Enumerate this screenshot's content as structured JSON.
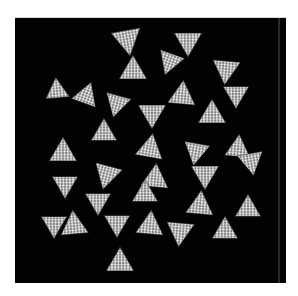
{
  "caption": {
    "text": ""
  },
  "figure": {
    "background_color": "#020202",
    "particle_color": "#e8e8e8",
    "panel": {
      "x": 15,
      "y": 17,
      "width": 271,
      "height": 265
    },
    "particles": [
      {
        "cx": 127,
        "cy": 38,
        "size": 28,
        "rot": 170
      },
      {
        "cx": 188,
        "cy": 40,
        "size": 26,
        "rot": 180
      },
      {
        "cx": 133,
        "cy": 70,
        "size": 26,
        "rot": 0
      },
      {
        "cx": 170,
        "cy": 60,
        "size": 24,
        "rot": 200
      },
      {
        "cx": 226,
        "cy": 68,
        "size": 26,
        "rot": 185
      },
      {
        "cx": 57,
        "cy": 90,
        "size": 22,
        "rot": 355
      },
      {
        "cx": 86,
        "cy": 95,
        "size": 24,
        "rot": 20
      },
      {
        "cx": 117,
        "cy": 102,
        "size": 24,
        "rot": 195
      },
      {
        "cx": 182,
        "cy": 95,
        "size": 26,
        "rot": 5
      },
      {
        "cx": 236,
        "cy": 93,
        "size": 24,
        "rot": 180
      },
      {
        "cx": 212,
        "cy": 114,
        "size": 26,
        "rot": 0
      },
      {
        "cx": 152,
        "cy": 112,
        "size": 26,
        "rot": 180
      },
      {
        "cx": 104,
        "cy": 132,
        "size": 24,
        "rot": 0
      },
      {
        "cx": 63,
        "cy": 152,
        "size": 26,
        "rot": 0
      },
      {
        "cx": 150,
        "cy": 148,
        "size": 26,
        "rot": 10
      },
      {
        "cx": 196,
        "cy": 150,
        "size": 24,
        "rot": 190
      },
      {
        "cx": 238,
        "cy": 148,
        "size": 24,
        "rot": 5
      },
      {
        "cx": 205,
        "cy": 173,
        "size": 26,
        "rot": 180
      },
      {
        "cx": 107,
        "cy": 173,
        "size": 26,
        "rot": 195
      },
      {
        "cx": 65,
        "cy": 183,
        "size": 24,
        "rot": 180
      },
      {
        "cx": 155,
        "cy": 178,
        "size": 26,
        "rot": 5
      },
      {
        "cx": 251,
        "cy": 160,
        "size": 24,
        "rot": 170
      },
      {
        "cx": 98,
        "cy": 200,
        "size": 24,
        "rot": 180
      },
      {
        "cx": 145,
        "cy": 193,
        "size": 24,
        "rot": 0
      },
      {
        "cx": 200,
        "cy": 205,
        "size": 26,
        "rot": 5
      },
      {
        "cx": 248,
        "cy": 208,
        "size": 24,
        "rot": 0
      },
      {
        "cx": 54,
        "cy": 223,
        "size": 24,
        "rot": 180
      },
      {
        "cx": 74,
        "cy": 225,
        "size": 26,
        "rot": 355
      },
      {
        "cx": 117,
        "cy": 222,
        "size": 24,
        "rot": 180
      },
      {
        "cx": 150,
        "cy": 225,
        "size": 26,
        "rot": 5
      },
      {
        "cx": 180,
        "cy": 230,
        "size": 26,
        "rot": 185
      },
      {
        "cx": 225,
        "cy": 230,
        "size": 24,
        "rot": 0
      },
      {
        "cx": 120,
        "cy": 262,
        "size": 26,
        "rot": 0
      }
    ]
  }
}
